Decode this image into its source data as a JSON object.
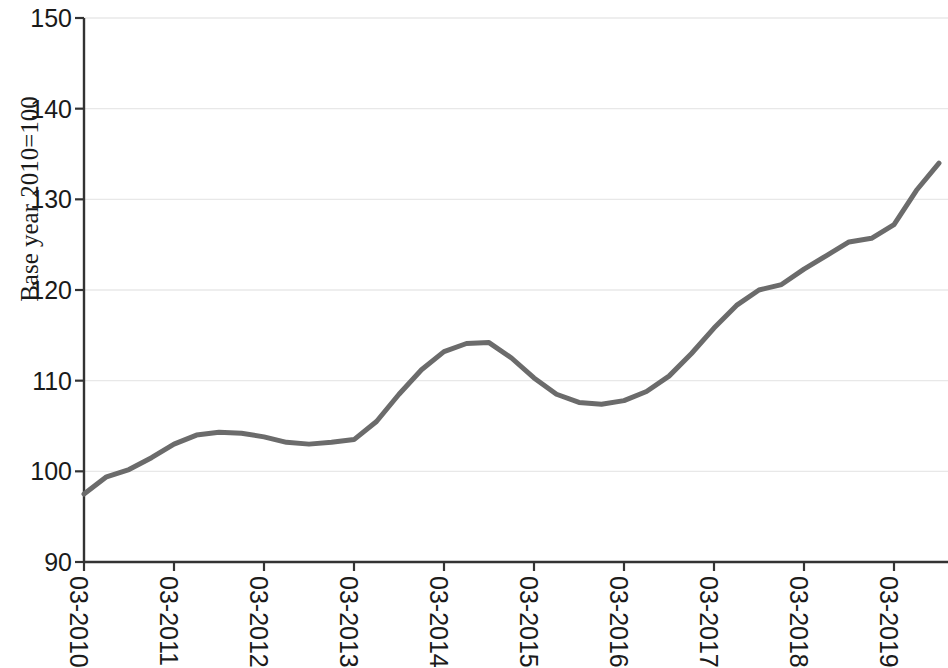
{
  "chart_data": {
    "type": "line",
    "title": "",
    "subtitle": "",
    "xlabel": "",
    "ylabel": "Base year 2010=100",
    "ylim": [
      90,
      150
    ],
    "ytick_values": [
      90,
      100,
      110,
      120,
      130,
      140,
      150
    ],
    "ytick_labels": [
      "90",
      "100",
      "110",
      "120",
      "130",
      "140",
      "150"
    ],
    "xtick_labels": [
      "03-2010",
      "03-2011",
      "03-2012",
      "03-2013",
      "03-2014",
      "03-2015",
      "03-2016",
      "03-2017",
      "03-2018",
      "03-2019"
    ],
    "grid": "horizontal-faint",
    "legend": "none",
    "line_color": "#6b6b6b",
    "line_width": 5,
    "axis_color": "#333333",
    "series": [
      {
        "name": "index",
        "x": [
          "03-2010",
          "06-2010",
          "09-2010",
          "12-2010",
          "03-2011",
          "06-2011",
          "09-2011",
          "12-2011",
          "03-2012",
          "06-2012",
          "09-2012",
          "12-2012",
          "03-2013",
          "06-2013",
          "09-2013",
          "12-2013",
          "03-2014",
          "06-2014",
          "09-2014",
          "12-2014",
          "03-2015",
          "06-2015",
          "09-2015",
          "12-2015",
          "03-2016",
          "06-2016",
          "09-2016",
          "12-2016",
          "03-2017",
          "06-2017",
          "09-2017",
          "12-2017",
          "03-2018",
          "06-2018",
          "09-2018",
          "12-2018",
          "03-2019",
          "06-2019",
          "09-2019"
        ],
        "values": [
          97.5,
          99.4,
          100.2,
          101.5,
          103.0,
          104.0,
          104.3,
          104.2,
          103.8,
          103.2,
          103.0,
          103.2,
          103.5,
          105.5,
          108.5,
          111.2,
          113.2,
          114.1,
          114.2,
          112.5,
          110.3,
          108.5,
          107.6,
          107.4,
          107.8,
          108.8,
          110.5,
          113.0,
          115.8,
          118.3,
          120.0,
          120.6,
          122.3,
          123.8,
          125.3,
          125.7,
          127.2,
          131.0,
          134.0
        ]
      }
    ]
  }
}
